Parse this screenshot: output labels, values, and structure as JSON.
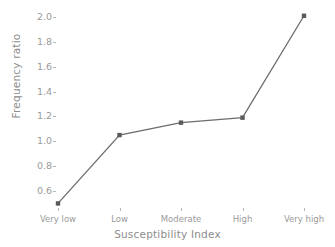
{
  "chart_data": {
    "type": "line",
    "title": "",
    "xlabel": "Susceptibility Index",
    "ylabel": "Frequency ratio",
    "categories": [
      "Very low",
      "Low",
      "Moderate",
      "High",
      "Very high"
    ],
    "values": [
      0.5,
      1.05,
      1.15,
      1.19,
      2.01
    ],
    "series": [
      {
        "name": "Frequency ratio",
        "values": [
          0.5,
          1.05,
          1.15,
          1.19,
          2.01
        ]
      }
    ],
    "ylim": [
      0.45,
      2.07
    ],
    "yticks": [
      0.6,
      0.8,
      1.0,
      1.2,
      1.4,
      1.6,
      1.8,
      2.0
    ],
    "ytick_labels": [
      "0.6",
      "0.8",
      "1.0",
      "1.2",
      "1.4",
      "1.6",
      "1.8",
      "2.0"
    ],
    "grid": false,
    "legend": "none",
    "line_color": "#6d6d6d",
    "marker_color": "#5a5a5a",
    "marker": "square",
    "text_color": "#9a9a9a",
    "background": "#ffffff"
  }
}
